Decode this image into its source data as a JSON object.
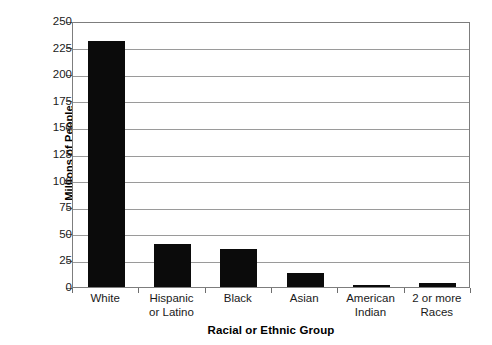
{
  "chart_data": {
    "type": "bar",
    "title": "",
    "xlabel": "Racial or Ethnic Group",
    "ylabel": "Millions of People",
    "categories": [
      "White",
      "Hispanic or Latino",
      "Black",
      "Asian",
      "American Indian",
      "2 or more Races"
    ],
    "category_lines": [
      [
        "White"
      ],
      [
        "Hispanic",
        "or Latino"
      ],
      [
        "Black"
      ],
      [
        "Asian"
      ],
      [
        "American",
        "Indian"
      ],
      [
        "2 or more",
        "Races"
      ]
    ],
    "values": [
      231,
      40,
      36,
      13,
      2,
      4
    ],
    "ylim": [
      0,
      250
    ],
    "yticks": [
      0,
      25,
      50,
      75,
      100,
      125,
      150,
      175,
      200,
      225,
      250
    ],
    "ytick_labels": [
      "0",
      "25",
      "50",
      "75",
      "100",
      "125",
      "150",
      "175",
      "200",
      "225",
      "250"
    ],
    "grid": true,
    "legend": false,
    "bar_color": "#0b0b0b",
    "gridline_color": "#9a9a9a",
    "axis_color": "#7d7d7d"
  }
}
